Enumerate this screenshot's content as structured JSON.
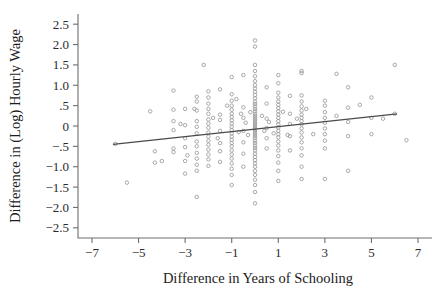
{
  "chart_data": {
    "type": "scatter",
    "title": "",
    "xlabel": "Difference in Years of Schooling",
    "ylabel": "Difference in (Log) Hourly Wage",
    "xlim": [
      -7.6,
      7.6
    ],
    "ylim": [
      -2.75,
      2.75
    ],
    "grid": false,
    "legend": null,
    "xticks": [
      -7,
      -5,
      -3,
      -1,
      1,
      3,
      5,
      7
    ],
    "xticklabels": [
      "−7",
      "−5",
      "−3",
      "−1",
      "1",
      "3",
      "5",
      "7"
    ],
    "yticks": [
      2.5,
      2.0,
      1.5,
      1.0,
      0.5,
      0,
      -0.5,
      -1.0,
      -1.5,
      -2.0,
      -2.5
    ],
    "yticklabels": [
      "2.5",
      "2.0",
      "1.5",
      "1.0",
      ".5",
      "0",
      "−.5",
      "−1.0",
      "−1.5",
      "−2.0",
      "−2.5"
    ],
    "marker": "open-circle",
    "marker_color": "#9a9a9a",
    "fit_line": {
      "label": "linear fit",
      "color": "#4a4a4a",
      "x_start": -6.1,
      "y_start": -0.45,
      "x_end": 6.1,
      "y_end": 0.3,
      "slope": 0.0615,
      "intercept": -0.0748
    },
    "points": [
      [
        -6.0,
        -0.44
      ],
      [
        -5.5,
        -1.39
      ],
      [
        -4.5,
        0.36
      ],
      [
        -4.3,
        -0.62
      ],
      [
        -4.3,
        -0.9
      ],
      [
        -4.0,
        -0.86
      ],
      [
        -3.5,
        0.87
      ],
      [
        -3.5,
        0.4
      ],
      [
        -3.5,
        0.12
      ],
      [
        -3.5,
        -0.1
      ],
      [
        -3.5,
        -0.55
      ],
      [
        -3.5,
        -0.64
      ],
      [
        -3.2,
        0.05
      ],
      [
        -3.0,
        0.42
      ],
      [
        -3.0,
        0.02
      ],
      [
        -3.0,
        -0.3
      ],
      [
        -3.0,
        -0.52
      ],
      [
        -3.0,
        -0.86
      ],
      [
        -3.0,
        -1.17
      ],
      [
        -2.9,
        -0.72
      ],
      [
        -2.6,
        0.42
      ],
      [
        -2.5,
        0.72
      ],
      [
        -2.5,
        0.6
      ],
      [
        -2.5,
        0.38
      ],
      [
        -2.5,
        0.12
      ],
      [
        -2.5,
        -0.02
      ],
      [
        -2.5,
        -0.18
      ],
      [
        -2.5,
        -0.38
      ],
      [
        -2.5,
        -0.5
      ],
      [
        -2.5,
        -0.66
      ],
      [
        -2.5,
        -0.8
      ],
      [
        -2.5,
        -0.95
      ],
      [
        -2.5,
        -1.1
      ],
      [
        -2.5,
        -1.74
      ],
      [
        -2.2,
        1.5
      ],
      [
        -2.0,
        0.85
      ],
      [
        -2.0,
        0.7
      ],
      [
        -2.0,
        0.55
      ],
      [
        -2.0,
        0.42
      ],
      [
        -2.0,
        0.3
      ],
      [
        -2.0,
        0.16
      ],
      [
        -2.0,
        0.06
      ],
      [
        -2.0,
        -0.04
      ],
      [
        -2.0,
        -0.16
      ],
      [
        -2.0,
        -0.26
      ],
      [
        -2.0,
        -0.36
      ],
      [
        -2.0,
        -0.46
      ],
      [
        -2.0,
        -0.58
      ],
      [
        -2.0,
        -0.7
      ],
      [
        -2.0,
        -0.82
      ],
      [
        -2.0,
        -0.98
      ],
      [
        -1.8,
        0.2
      ],
      [
        -1.6,
        -0.3
      ],
      [
        -1.5,
        0.9
      ],
      [
        -1.5,
        0.28
      ],
      [
        -1.5,
        0.15
      ],
      [
        -1.5,
        -0.12
      ],
      [
        -1.5,
        -0.42
      ],
      [
        -1.5,
        -0.62
      ],
      [
        -1.5,
        -0.88
      ],
      [
        -1.2,
        0.5
      ],
      [
        -1.0,
        1.2
      ],
      [
        -1.0,
        0.78
      ],
      [
        -1.0,
        0.62
      ],
      [
        -1.0,
        0.5
      ],
      [
        -1.0,
        0.4
      ],
      [
        -1.0,
        0.3
      ],
      [
        -1.0,
        0.22
      ],
      [
        -1.0,
        0.14
      ],
      [
        -1.0,
        0.06
      ],
      [
        -1.0,
        -0.02
      ],
      [
        -1.0,
        -0.1
      ],
      [
        -1.0,
        -0.18
      ],
      [
        -1.0,
        -0.26
      ],
      [
        -1.0,
        -0.34
      ],
      [
        -1.0,
        -0.42
      ],
      [
        -1.0,
        -0.5
      ],
      [
        -1.0,
        -0.6
      ],
      [
        -1.0,
        -0.7
      ],
      [
        -1.0,
        -0.8
      ],
      [
        -1.0,
        -0.92
      ],
      [
        -1.0,
        -1.05
      ],
      [
        -1.0,
        -1.2
      ],
      [
        -1.0,
        -1.45
      ],
      [
        -0.8,
        0.66
      ],
      [
        -0.7,
        -0.15
      ],
      [
        -0.6,
        0.3
      ],
      [
        -0.5,
        1.25
      ],
      [
        -0.5,
        0.46
      ],
      [
        -0.5,
        0.2
      ],
      [
        -0.5,
        -0.12
      ],
      [
        -0.5,
        -0.4
      ],
      [
        -0.5,
        -0.68
      ],
      [
        -0.5,
        -1.0
      ],
      [
        -0.4,
        0.08
      ],
      [
        -0.3,
        -0.22
      ],
      [
        -0.2,
        0.34
      ],
      [
        0.0,
        2.1
      ],
      [
        0.0,
        1.95
      ],
      [
        0.0,
        1.5
      ],
      [
        0.0,
        1.35
      ],
      [
        0.0,
        1.22
      ],
      [
        0.0,
        1.1
      ],
      [
        0.0,
        1.0
      ],
      [
        0.0,
        0.92
      ],
      [
        0.0,
        0.84
      ],
      [
        0.0,
        0.76
      ],
      [
        0.0,
        0.68
      ],
      [
        0.0,
        0.6
      ],
      [
        0.0,
        0.54
      ],
      [
        0.0,
        0.48
      ],
      [
        0.0,
        0.42
      ],
      [
        0.0,
        0.36
      ],
      [
        0.0,
        0.3
      ],
      [
        0.0,
        0.25
      ],
      [
        0.0,
        0.2
      ],
      [
        0.0,
        0.15
      ],
      [
        0.0,
        0.1
      ],
      [
        0.0,
        0.05
      ],
      [
        0.0,
        0.0
      ],
      [
        0.0,
        -0.05
      ],
      [
        0.0,
        -0.1
      ],
      [
        0.0,
        -0.15
      ],
      [
        0.0,
        -0.2
      ],
      [
        0.0,
        -0.25
      ],
      [
        0.0,
        -0.3
      ],
      [
        0.0,
        -0.36
      ],
      [
        0.0,
        -0.42
      ],
      [
        0.0,
        -0.48
      ],
      [
        0.0,
        -0.54
      ],
      [
        0.0,
        -0.6
      ],
      [
        0.0,
        -0.68
      ],
      [
        0.0,
        -0.76
      ],
      [
        0.0,
        -0.84
      ],
      [
        0.0,
        -0.92
      ],
      [
        0.0,
        -1.0
      ],
      [
        0.0,
        -1.1
      ],
      [
        0.0,
        -1.2
      ],
      [
        0.0,
        -1.32
      ],
      [
        0.0,
        -1.45
      ],
      [
        0.0,
        -1.62
      ],
      [
        0.0,
        -1.9
      ],
      [
        0.3,
        0.25
      ],
      [
        0.4,
        -0.12
      ],
      [
        0.5,
        0.95
      ],
      [
        0.5,
        0.55
      ],
      [
        0.5,
        0.18
      ],
      [
        0.5,
        -0.05
      ],
      [
        0.5,
        -0.3
      ],
      [
        0.5,
        -0.55
      ],
      [
        0.6,
        0.1
      ],
      [
        0.8,
        -0.18
      ],
      [
        1.0,
        1.25
      ],
      [
        1.0,
        1.05
      ],
      [
        1.0,
        0.82
      ],
      [
        1.0,
        0.7
      ],
      [
        1.0,
        0.6
      ],
      [
        1.0,
        0.52
      ],
      [
        1.0,
        0.44
      ],
      [
        1.0,
        0.36
      ],
      [
        1.0,
        0.28
      ],
      [
        1.0,
        0.2
      ],
      [
        1.0,
        0.12
      ],
      [
        1.0,
        0.04
      ],
      [
        1.0,
        -0.04
      ],
      [
        1.0,
        -0.12
      ],
      [
        1.0,
        -0.2
      ],
      [
        1.0,
        -0.28
      ],
      [
        1.0,
        -0.38
      ],
      [
        1.0,
        -0.48
      ],
      [
        1.0,
        -0.6
      ],
      [
        1.0,
        -0.74
      ],
      [
        1.0,
        -0.9
      ],
      [
        1.0,
        -1.1
      ],
      [
        1.0,
        -1.35
      ],
      [
        1.2,
        0.35
      ],
      [
        1.4,
        -0.22
      ],
      [
        1.5,
        0.74
      ],
      [
        1.5,
        0.3
      ],
      [
        1.5,
        0.05
      ],
      [
        1.5,
        -0.25
      ],
      [
        1.5,
        -0.6
      ],
      [
        1.8,
        0.18
      ],
      [
        2.0,
        1.35
      ],
      [
        2.0,
        1.3
      ],
      [
        2.0,
        0.75
      ],
      [
        2.0,
        0.6
      ],
      [
        2.0,
        0.48
      ],
      [
        2.0,
        0.38
      ],
      [
        2.0,
        0.28
      ],
      [
        2.0,
        0.2
      ],
      [
        2.0,
        0.12
      ],
      [
        2.0,
        0.04
      ],
      [
        2.0,
        -0.06
      ],
      [
        2.0,
        -0.16
      ],
      [
        2.0,
        -0.28
      ],
      [
        2.0,
        -0.4
      ],
      [
        2.0,
        -0.55
      ],
      [
        2.0,
        -0.72
      ],
      [
        2.0,
        -1.0
      ],
      [
        2.0,
        -1.3
      ],
      [
        2.2,
        0.42
      ],
      [
        2.5,
        -0.2
      ],
      [
        3.0,
        0.62
      ],
      [
        3.0,
        0.5
      ],
      [
        3.0,
        0.34
      ],
      [
        3.0,
        0.2
      ],
      [
        3.0,
        0.08
      ],
      [
        3.0,
        -0.06
      ],
      [
        3.0,
        -0.2
      ],
      [
        3.0,
        -0.36
      ],
      [
        3.0,
        -0.55
      ],
      [
        3.0,
        -1.3
      ],
      [
        3.5,
        1.28
      ],
      [
        3.5,
        0.25
      ],
      [
        4.0,
        0.95
      ],
      [
        4.0,
        0.45
      ],
      [
        4.0,
        0.1
      ],
      [
        4.0,
        -0.25
      ],
      [
        4.0,
        -1.1
      ],
      [
        4.5,
        0.52
      ],
      [
        5.0,
        0.7
      ],
      [
        5.0,
        0.2
      ],
      [
        5.0,
        -0.2
      ],
      [
        5.5,
        0.18
      ],
      [
        6.0,
        1.5
      ],
      [
        6.0,
        0.3
      ],
      [
        6.5,
        -0.35
      ]
    ]
  }
}
